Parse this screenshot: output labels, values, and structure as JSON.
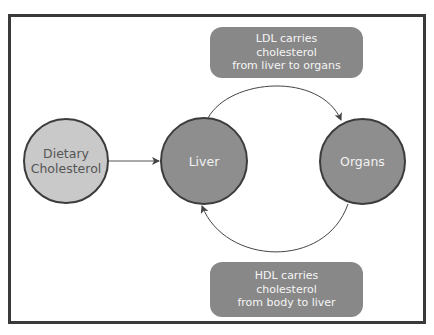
{
  "diagram": {
    "type": "flow-cycle",
    "nodes": {
      "dietary": {
        "label": "Dietary\nCholesterol",
        "fill": "#c9c9c9",
        "text_color": "#555555"
      },
      "liver": {
        "label": "Liver",
        "fill": "#8e8e8e",
        "text_color": "#f2f2f2"
      },
      "organs": {
        "label": "Organs",
        "fill": "#8e8e8e",
        "text_color": "#f2f2f2"
      }
    },
    "labels": {
      "ldl": "LDL carries\ncholesterol\nfrom liver to organs",
      "hdl": "HDL carries\ncholesterol\nfrom body to liver"
    },
    "edges": [
      {
        "from": "Dietary Cholesterol",
        "to": "Liver",
        "style": "straight-arrow"
      },
      {
        "from": "Liver",
        "to": "Organs",
        "style": "curved-arrow-top",
        "label": "LDL carries cholesterol from liver to organs"
      },
      {
        "from": "Organs",
        "to": "Liver",
        "style": "curved-arrow-bottom",
        "label": "HDL carries cholesterol from body to liver"
      }
    ],
    "colors": {
      "frame": "#3a3a3a",
      "label_box": "#888888",
      "edge": "#444444"
    }
  }
}
